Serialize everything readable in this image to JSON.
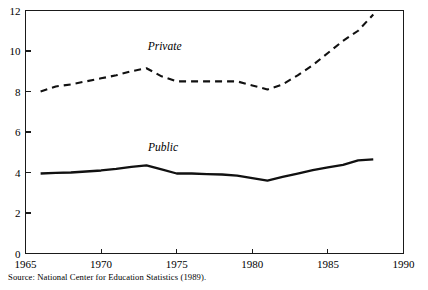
{
  "source_note": "Source: National Center for Education Statistics (1989).",
  "chart_data": {
    "type": "line",
    "title": "",
    "subtitle": "",
    "xlabel": "",
    "ylabel": "",
    "xlim": [
      1965,
      1990
    ],
    "ylim": [
      0,
      12
    ],
    "xticks": [
      1965,
      1970,
      1975,
      1980,
      1985,
      1990
    ],
    "xticklabels": [
      "1965",
      "1970",
      "1975",
      "1980",
      "1985",
      "1990"
    ],
    "yticks": [
      0,
      2,
      4,
      6,
      8,
      10,
      12
    ],
    "yticklabels": [
      "0",
      "2",
      "4",
      "6",
      "8",
      "10",
      "12"
    ],
    "grid": false,
    "legend_position": "inline-annotations",
    "x": [
      1966,
      1967,
      1968,
      1969,
      1970,
      1971,
      1972,
      1973,
      1974,
      1975,
      1976,
      1977,
      1978,
      1979,
      1980,
      1981,
      1982,
      1983,
      1984,
      1985,
      1986,
      1987,
      1988
    ],
    "series": [
      {
        "name": "Private",
        "style": "dashed",
        "color": "#111111",
        "label_x": 1974.2,
        "label_y": 10.05,
        "values": [
          8.0,
          8.25,
          8.35,
          8.5,
          8.65,
          8.8,
          9.0,
          9.15,
          8.75,
          8.5,
          8.5,
          8.5,
          8.5,
          8.5,
          8.3,
          8.1,
          8.35,
          8.8,
          9.3,
          9.9,
          10.5,
          11.0,
          11.8
        ]
      },
      {
        "name": "Public",
        "style": "solid",
        "color": "#111111",
        "label_x": 1974.1,
        "label_y": 5.05,
        "values": [
          3.95,
          3.98,
          4.0,
          4.05,
          4.1,
          4.18,
          4.28,
          4.35,
          4.15,
          3.95,
          3.95,
          3.92,
          3.9,
          3.85,
          3.72,
          3.6,
          3.78,
          3.95,
          4.12,
          4.25,
          4.38,
          4.6,
          4.65
        ]
      }
    ]
  },
  "axis": {
    "y_tick_labels": [
      "12",
      "10",
      "8",
      "6",
      "4",
      "2",
      "0"
    ],
    "x_tick_labels": [
      "1965",
      "1970",
      "1975",
      "1980",
      "1985",
      "1990"
    ]
  }
}
